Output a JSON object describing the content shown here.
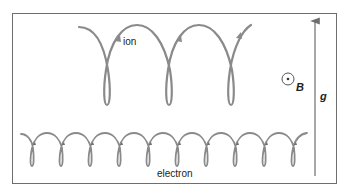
{
  "diagram": {
    "type": "physics-particle-drift",
    "labels": {
      "ion": "ion",
      "electron": "electron",
      "magnetic_field": "B",
      "gravity": "g"
    },
    "symbols": {
      "magnetic_field_direction": "out-of-page (dot in circle)",
      "gravity_arrow_direction": "up"
    },
    "trajectories": {
      "ion": {
        "loops_visible": 3,
        "drift_direction": "right"
      },
      "electron": {
        "loops_visible": 10,
        "drift_direction": "right"
      }
    },
    "colors": {
      "trajectory": "#8a8a8a",
      "frame": "#6e6e6e",
      "arrow": "#6e6e6e",
      "text": "#222222"
    }
  }
}
